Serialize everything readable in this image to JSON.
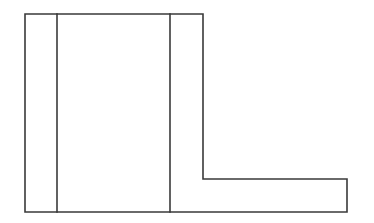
{
  "diagram": {
    "type": "technical-line-drawing",
    "canvas": {
      "width": 374,
      "height": 223
    },
    "colors": {
      "background": "#ffffff",
      "stroke": "#3a3a3a"
    },
    "stroke_width": 1.6,
    "outline_points": [
      [
        25,
        14
      ],
      [
        203,
        14
      ],
      [
        203,
        179
      ],
      [
        347,
        179
      ],
      [
        347,
        212
      ],
      [
        25,
        212
      ]
    ],
    "dividers": [
      {
        "name": "left-divider",
        "x": 57,
        "y1": 14,
        "y2": 212
      },
      {
        "name": "right-divider",
        "x": 170,
        "y1": 14,
        "y2": 212
      }
    ],
    "labels": []
  }
}
